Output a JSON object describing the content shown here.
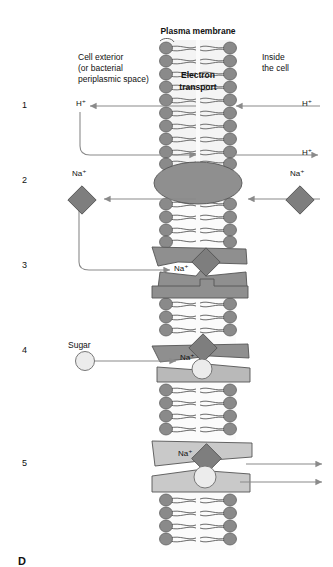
{
  "figure": {
    "title": "Plasma membrane",
    "bottom_label": "D",
    "left_label_lines": [
      "Cell exterior",
      "(or bacterial",
      "periplasmic space)"
    ],
    "right_label_lines": [
      "Inside",
      "the cell"
    ],
    "protein_label_lines": [
      "Electron",
      "transport"
    ],
    "step_numbers": [
      "1",
      "2",
      "3",
      "4",
      "5"
    ],
    "ions": {
      "proton": "H⁺",
      "sodium": "Na⁺",
      "sugar": "Sugar"
    },
    "steps": [
      {
        "number": "1",
        "left_species": "H⁺",
        "right_species": "H⁺",
        "return_species": "H⁺",
        "machine": "electron-transport-chain"
      },
      {
        "number": "2",
        "left_species": "Na⁺",
        "right_species": "Na⁺",
        "machine": "sodium-proton-antiporter"
      },
      {
        "number": "3",
        "return_species": "Na⁺",
        "machine": "sodium-sugar-symporter-open"
      },
      {
        "number": "4",
        "left_species": "Sugar",
        "bound_species": "Na⁺",
        "machine": "sodium-sugar-symporter-bound"
      },
      {
        "number": "5",
        "bound_species": "Na⁺",
        "machine": "sodium-sugar-symporter-release"
      }
    ]
  },
  "colors": {
    "lipid_head": "#848484",
    "lipid_head_dark": "#6f6f6f",
    "lipid_tail": "#f2f2f2",
    "protein_dark": "#8a8a8a",
    "protein_mid": "#9a9a9a",
    "protein_light": "#c9c9c9",
    "ion_diamond": "#7e7e7e",
    "sugar_fill": "#ececec",
    "arrow": "#8a8a8a",
    "outline": "#4a4a4a",
    "text": "#111111",
    "background": "#ffffff"
  }
}
